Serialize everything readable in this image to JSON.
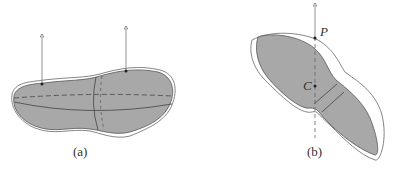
{
  "panels": [
    {
      "id": "a",
      "caption": "(a)"
    },
    {
      "id": "b",
      "caption": "(b)",
      "points": [
        {
          "name": "P"
        },
        {
          "name": "C"
        }
      ]
    }
  ],
  "colors": {
    "fill": "#a8a8a8",
    "stroke": "#555555"
  }
}
